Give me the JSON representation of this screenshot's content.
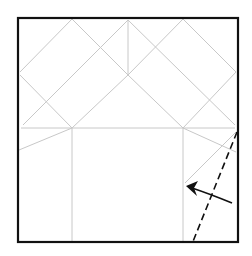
{
  "diagram": {
    "type": "origami-fold-step",
    "colors": {
      "background": "#ffffff",
      "border": "#111111",
      "crease": "#c8c8c8",
      "fold_line": "#111111",
      "arrow": "#111111"
    },
    "paper": {
      "x": 18,
      "y": 18,
      "width": 220,
      "height": 224
    },
    "creases": [
      {
        "x1": 72,
        "y1": 19,
        "x2": 20,
        "y2": 72
      },
      {
        "x1": 72,
        "y1": 19,
        "x2": 128,
        "y2": 75
      },
      {
        "x1": 128,
        "y1": 20,
        "x2": 23,
        "y2": 125
      },
      {
        "x1": 128,
        "y1": 20,
        "x2": 128,
        "y2": 75
      },
      {
        "x1": 128,
        "y1": 20,
        "x2": 235,
        "y2": 125
      },
      {
        "x1": 183,
        "y1": 19,
        "x2": 128,
        "y2": 75
      },
      {
        "x1": 183,
        "y1": 19,
        "x2": 236,
        "y2": 72
      },
      {
        "x1": 20,
        "y1": 75,
        "x2": 72,
        "y2": 128
      },
      {
        "x1": 236,
        "y1": 72,
        "x2": 183,
        "y2": 128
      },
      {
        "x1": 128,
        "y1": 75,
        "x2": 72,
        "y2": 128
      },
      {
        "x1": 128,
        "y1": 75,
        "x2": 183,
        "y2": 128
      },
      {
        "x1": 21,
        "y1": 128,
        "x2": 235,
        "y2": 128
      },
      {
        "x1": 72,
        "y1": 128,
        "x2": 19,
        "y2": 150
      },
      {
        "x1": 183,
        "y1": 128,
        "x2": 236,
        "y2": 152
      },
      {
        "x1": 72,
        "y1": 128,
        "x2": 72,
        "y2": 241
      },
      {
        "x1": 183,
        "y1": 128,
        "x2": 183,
        "y2": 241
      },
      {
        "x1": 236,
        "y1": 132,
        "x2": 185,
        "y2": 183
      }
    ],
    "valley_fold_line": {
      "x1": 237,
      "y1": 132,
      "x2": 192,
      "y2": 244,
      "dash": "7 4"
    },
    "arrow": {
      "path": "M 232 203 Q 210 194 192 188",
      "head": "M 186 186 L 198 181 L 194 188 L 197 196 Z"
    }
  }
}
